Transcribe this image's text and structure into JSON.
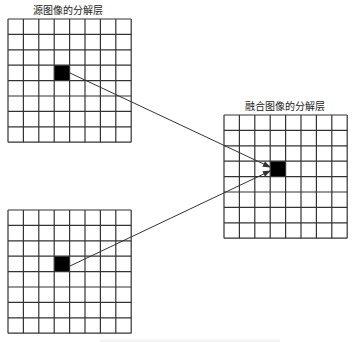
{
  "diagram": {
    "title_labels": {
      "source": "源图像的分解层",
      "fused": "融合图像的分解层"
    },
    "colors": {
      "grid_line": "#333333",
      "highlight_cell": "#000000",
      "arrow": "#333333",
      "background": "#ffffff"
    },
    "grids": [
      {
        "id": "source-top",
        "x": 8,
        "y": 19,
        "cell": 15.4,
        "rows": 8,
        "cols": 8,
        "highlight": {
          "row": 3,
          "col": 3
        }
      },
      {
        "id": "source-bottom",
        "x": 8,
        "y": 210,
        "cell": 15.4,
        "rows": 8,
        "cols": 8,
        "highlight": {
          "row": 3,
          "col": 3
        }
      },
      {
        "id": "fused",
        "x": 224,
        "y": 115,
        "cell": 15.4,
        "rows": 8,
        "cols": 8,
        "highlight": {
          "row": 3,
          "col": 3
        }
      }
    ],
    "arrows": [
      {
        "from": [
          70,
          73
        ],
        "to": [
          270,
          167
        ]
      },
      {
        "from": [
          70,
          266
        ],
        "to": [
          270,
          171
        ]
      }
    ],
    "label_positions": {
      "source": {
        "x": 33,
        "y": 2
      },
      "fused": {
        "x": 245,
        "y": 98
      }
    }
  }
}
